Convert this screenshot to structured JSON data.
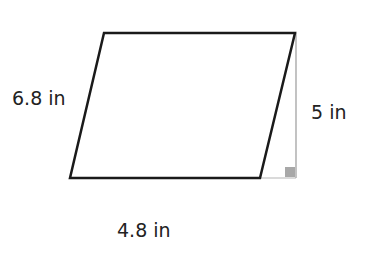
{
  "diagram": {
    "shape": "parallelogram",
    "labels": {
      "side": "6.8 in",
      "height": "5 in",
      "base": "4.8 in"
    },
    "colors": {
      "outline": "#1a1a1a",
      "height_line": "#9a9a9a",
      "right_angle_marker": "#a8a8a8",
      "text": "#222222"
    },
    "vertices": {
      "top_left": [
        104,
        33
      ],
      "top_right": [
        295,
        33
      ],
      "bottom_right": [
        260,
        178
      ],
      "bottom_left": [
        70,
        178
      ]
    }
  }
}
